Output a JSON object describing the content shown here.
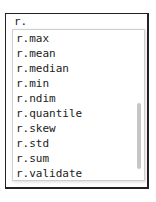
{
  "input": {
    "value": "r."
  },
  "completions": [
    {
      "label": "r.max"
    },
    {
      "label": "r.mean"
    },
    {
      "label": "r.median"
    },
    {
      "label": "r.min"
    },
    {
      "label": "r.ndim"
    },
    {
      "label": "r.quantile"
    },
    {
      "label": "r.skew"
    },
    {
      "label": "r.std"
    },
    {
      "label": "r.sum"
    },
    {
      "label": "r.validate"
    }
  ]
}
